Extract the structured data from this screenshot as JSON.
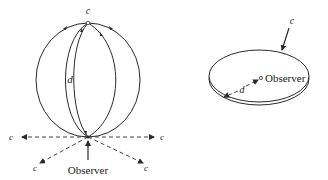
{
  "figure": {
    "left_panel": {
      "name": "spherical-universe",
      "top_label": "c",
      "distance_label": "d",
      "observer_label": "Observer",
      "horizon_labels": [
        "c",
        "c",
        "c",
        "c"
      ]
    },
    "right_panel": {
      "name": "flat-disk-universe",
      "edge_label": "c",
      "distance_label": "d",
      "observer_label": "Observer"
    }
  },
  "colors": {
    "line": "#2a2a2a",
    "background": "#ffffff"
  }
}
